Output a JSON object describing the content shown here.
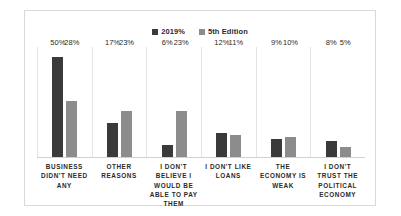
{
  "chart_data": {
    "type": "bar",
    "title": "",
    "subtitle": "",
    "xlabel": "",
    "ylabel": "",
    "ylim": [
      0,
      55
    ],
    "grid": "vertical-category-separators",
    "legend_position": "top-center",
    "categories": [
      "BUSINESS DIDN'T NEED ANY",
      "OTHER REASONS",
      "I DON'T BELIEVE I WOULD BE ABLE TO PAY THEM",
      "I DON'T LIKE LOANS",
      "THE ECONOMY IS WEAK",
      "I DON'T TRUST THE POLITICAL ECONOMY"
    ],
    "series": [
      {
        "name": "2019%",
        "color": "#3a3a3a",
        "values": [
          50,
          17,
          6,
          12,
          9,
          8
        ],
        "labels": [
          "50%",
          "17%",
          "6%",
          "12%",
          "9%",
          "8%"
        ]
      },
      {
        "name": "5th Edition",
        "color": "#8c8c8c",
        "values": [
          28,
          23,
          23,
          11,
          10,
          5
        ],
        "labels": [
          "28%",
          "23%",
          "23%",
          "11%",
          "10%",
          "5%"
        ]
      }
    ]
  },
  "legend": {
    "items": [
      {
        "label": "2019%",
        "color": "#3a3a3a"
      },
      {
        "label": "5th Edition",
        "color": "#8c8c8c"
      }
    ]
  },
  "colors": {
    "series_1": "#3a3a3a",
    "series_2": "#8c8c8c",
    "card_border": "#d9d9d9",
    "gridline": "#e4e4e4",
    "baseline": "#d0d0d0",
    "text": "#2b2b2b",
    "background": "#ffffff"
  }
}
